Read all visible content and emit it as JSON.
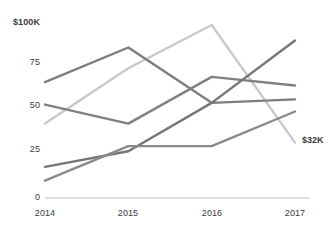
{
  "chart_data": {
    "type": "line",
    "title": "",
    "subtitle": "",
    "xlabel": "",
    "ylabel": "",
    "categories": [
      "2014",
      "2015",
      "2016",
      "2017"
    ],
    "x_tick_labels": [
      "2014",
      "2015",
      "2016",
      "2017"
    ],
    "y_tick_labels": [
      "0",
      "25",
      "50",
      "75",
      "$100K"
    ],
    "y_tick_values": [
      0,
      25,
      50,
      75,
      100
    ],
    "ylim": [
      0,
      100
    ],
    "xlim": [
      "2014",
      "2017"
    ],
    "grid": false,
    "legend": "none",
    "units": "thousands of dollars",
    "annotations": [
      {
        "text": "$32K",
        "series": "series-1",
        "at_category": "2017",
        "value": 32
      }
    ],
    "series": [
      {
        "name": "series-1",
        "color": "#c9c9c9",
        "values": [
          43,
          75,
          100,
          32
        ]
      },
      {
        "name": "series-2",
        "color": "#7d7d7d",
        "values": [
          67,
          87,
          55,
          57
        ]
      },
      {
        "name": "series-3",
        "color": "#808080",
        "values": [
          54,
          43,
          70,
          65
        ]
      },
      {
        "name": "series-4",
        "color": "#767676",
        "values": [
          18,
          27,
          55,
          91
        ]
      },
      {
        "name": "series-5",
        "color": "#8a8a8a",
        "values": [
          10,
          30,
          30,
          50
        ]
      }
    ]
  },
  "axis": {
    "baseline_color": "#d4d4d4",
    "tick_text_color": "#3b3b3b"
  }
}
